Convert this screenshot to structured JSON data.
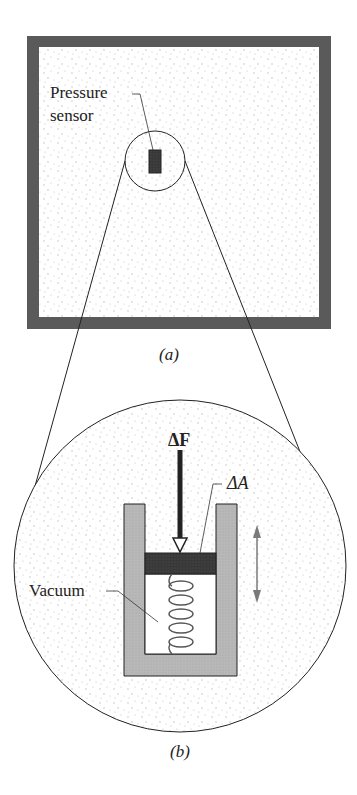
{
  "figure": {
    "panel_a": {
      "caption": "(a)",
      "sensor_label_line1": "Pressure",
      "sensor_label_line2": "sensor"
    },
    "panel_b": {
      "caption": "(b)",
      "force_label": "ΔF",
      "area_label": "ΔA",
      "vacuum_label": "Vacuum"
    },
    "colors": {
      "wall": "#5a5a5a",
      "fluid_dots": "#b8b8b8",
      "sensor": "#3a3a3a",
      "cylinder": "#b5b5b5",
      "piston": "#333333",
      "spring": "#555555",
      "motion_arrow": "#7a7a7a",
      "line": "#222222"
    }
  }
}
